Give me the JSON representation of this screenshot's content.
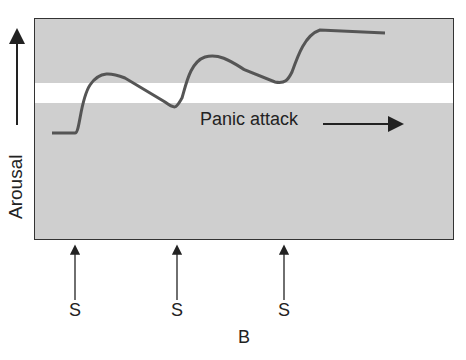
{
  "figure": {
    "y_axis_label": "Arousal",
    "annotation": "Panic attack",
    "stimulus_labels": [
      "S",
      "S",
      "S"
    ],
    "panel_label": "B"
  },
  "colors": {
    "background_region": "#cfcfcf",
    "threshold_band": "#ffffff",
    "curve": "#555555",
    "frame": "#333333"
  }
}
